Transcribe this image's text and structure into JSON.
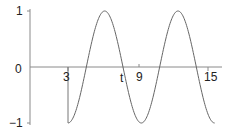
{
  "chart_data": {
    "type": "line",
    "title": "",
    "xlabel": "t",
    "ylabel": "",
    "x_ticks": [
      3,
      9,
      15
    ],
    "x_tick_labels": [
      "3",
      "t",
      "9",
      "15"
    ],
    "y_ticks": [
      -1,
      0,
      1
    ],
    "y_tick_labels": [
      "−1",
      "0",
      "1"
    ],
    "xlim": [
      0,
      16
    ],
    "ylim": [
      -1,
      1
    ],
    "grid": false,
    "legend": null,
    "function": "y = -cos(t - 3) for t >= 3, with a vertical segment at t = 3 from y = 0 to y = -1",
    "series": [
      {
        "name": "y(t)",
        "color": "#555555",
        "x": [
          3,
          3.785,
          4.571,
          5.356,
          6.142,
          6.927,
          7.712,
          8.498,
          9.283,
          10.069,
          10.854,
          11.639,
          12.425,
          13.21,
          13.996,
          14.781,
          15.566
        ],
        "values": [
          -1,
          -0.707,
          0,
          0.707,
          1,
          0.707,
          0,
          -0.707,
          -1,
          -0.707,
          0,
          0.707,
          1,
          0.707,
          0,
          -0.707,
          -1
        ]
      }
    ],
    "annotations": [
      {
        "type": "vertical-segment",
        "x": 3,
        "y_from": 0,
        "y_to": -1
      }
    ]
  },
  "labels": {
    "y_one": "1",
    "y_zero": "0",
    "y_minus_one": "−1",
    "x_three": "3",
    "x_t": "t",
    "x_nine": "9",
    "x_fifteen": "15"
  },
  "colors": {
    "axis": "#888888",
    "curve": "#666666",
    "text": "#222222"
  }
}
